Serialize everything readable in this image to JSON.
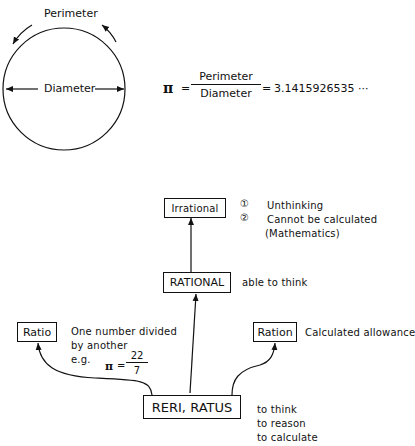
{
  "circle_diagram": {
    "perimeter_label": "Perimeter",
    "diameter_label": "Diameter"
  },
  "pi_formula": {
    "symbol": "π",
    "equals1": "=",
    "numerator": "Perimeter",
    "denominator": "Diameter",
    "equals2": "=",
    "value": "3.1415926535 ···"
  },
  "etymology_tree": {
    "root": {
      "label": "RERI, RATUS",
      "meanings": [
        "to think",
        "to reason",
        "to calculate"
      ]
    },
    "rational": {
      "label": "RATIONAL",
      "note": "able to think"
    },
    "irrational": {
      "label": "Irrational",
      "notes": [
        {
          "marker": "①",
          "text": "Unthinking"
        },
        {
          "marker": "②",
          "text": "Cannot be calculated"
        },
        {
          "marker": "",
          "text": "(Mathematics)"
        }
      ]
    },
    "ratio": {
      "label": "Ratio",
      "note_lines": [
        "One number divided",
        "by another",
        "e.g."
      ],
      "example": {
        "symbol": "π",
        "equals": "=",
        "numerator": "22",
        "denominator": "7"
      }
    },
    "ration": {
      "label": "Ration",
      "note": "Calculated allowance"
    }
  }
}
